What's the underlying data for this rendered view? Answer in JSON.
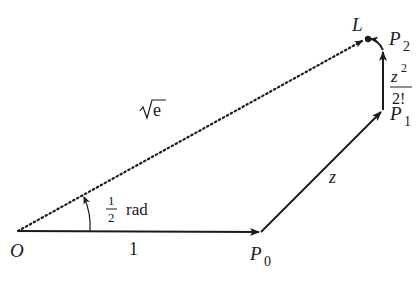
{
  "diagram": {
    "type": "vector-addition-spiral",
    "points": {
      "O": {
        "label": "O",
        "x": 18,
        "y": 231
      },
      "P0": {
        "label": "P",
        "sub": "0",
        "x": 261,
        "y": 232
      },
      "P1": {
        "label": "P",
        "sub": "1",
        "x": 383,
        "y": 110
      },
      "P2": {
        "label": "P",
        "sub": "2",
        "x": 383,
        "y": 50
      },
      "L": {
        "label": "L",
        "x": 368,
        "y": 39
      }
    },
    "edge_labels": {
      "O_P0": "1",
      "P0_P1": "z",
      "P1_P2_num": "z",
      "P1_P2_num_exp": "2",
      "P1_P2_den": "2!",
      "O_L": "√e"
    },
    "angle_label": {
      "num": "1",
      "den": "2",
      "unit": "rad"
    },
    "colors": {
      "stroke": "#1a1a1a",
      "background": "#ffffff"
    }
  }
}
